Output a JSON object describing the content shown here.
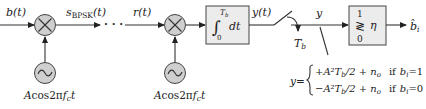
{
  "diagram": {
    "signals": {
      "input": "b(t)",
      "transmitted": {
        "base": "s",
        "sub": "BPSK",
        "suffix": "(t)"
      },
      "continuation": "· · ·",
      "received": "r(t)",
      "integrator_output": "y(t)",
      "sample": "y",
      "sampling_instant": {
        "base": "T",
        "sub": "b"
      },
      "decision_output": {
        "base": "b̂",
        "sub": "i"
      }
    },
    "modulator": {
      "mixer_symbol": "×",
      "oscillator_symbol": "~",
      "carrier_label": {
        "pre": "A",
        "fn": "cos",
        "mid": "2π",
        "f": "f",
        "sub": "c",
        "post": "t"
      }
    },
    "demodulator": {
      "mixer_symbol": "×",
      "oscillator_symbol": "~",
      "carrier_label": {
        "pre": "A",
        "fn": "cos",
        "mid": "2π",
        "f": "f",
        "sub": "c",
        "post": "t"
      }
    },
    "integrator": {
      "upper_limit": "T",
      "upper_sub": "b",
      "lower_limit": "0",
      "integrand": "dt"
    },
    "decision": {
      "top": "1",
      "comparator": "≷",
      "bottom": "0",
      "threshold": "η"
    },
    "equation": {
      "lhs": "y",
      "cases": [
        {
          "expr_sign": "+",
          "expr": "A²T",
          "expr_sub": "b",
          "expr_tail": "/2 + n",
          "noise_sub": "o",
          "cond": "if",
          "cond_var": "b",
          "cond_sub": "i",
          "cond_val": "=1"
        },
        {
          "expr_sign": "−",
          "expr": "A²T",
          "expr_sub": "b",
          "expr_tail": "/2 + n",
          "noise_sub": "o",
          "cond": "if",
          "cond_var": "b",
          "cond_sub": "i",
          "cond_val": "=0"
        }
      ]
    }
  }
}
